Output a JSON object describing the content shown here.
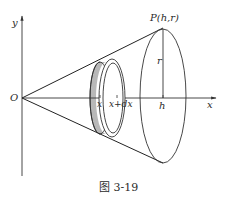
{
  "figure": {
    "caption": "图 3-19",
    "labels": {
      "y_axis": "y",
      "x_axis": "x",
      "origin": "O",
      "point": "P(h,r)",
      "radius": "r",
      "h": "h",
      "x_pos": "x",
      "x_dx": "x+dx"
    },
    "colors": {
      "stroke": "#333333",
      "shade": "#b8b8b8",
      "background": "#ffffff"
    }
  }
}
